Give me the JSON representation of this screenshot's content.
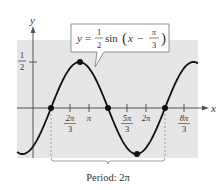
{
  "chart_data": {
    "type": "line",
    "function": "y = 0.5*sin(x - pi/3)",
    "xlabel": "x",
    "ylabel": "y",
    "x_ticks": [
      {
        "label_num": "2π",
        "label_den": "3",
        "value": 2.0944
      },
      {
        "label": "π",
        "value": 3.1416
      },
      {
        "label_num": "5π",
        "label_den": "3",
        "value": 5.236
      },
      {
        "label": "2π",
        "value": 6.2832
      },
      {
        "label_num": "8π",
        "label_den": "3",
        "value": 8.3776
      }
    ],
    "y_ticks": [
      {
        "label_num": "1",
        "label_den": "2",
        "value": 0.5
      }
    ],
    "key_points": [
      {
        "x": 1.0472,
        "y": 0,
        "desc": "π/3 zero"
      },
      {
        "x": 2.618,
        "y": 0.5,
        "desc": "max 5π/6"
      },
      {
        "x": 4.1888,
        "y": 0,
        "desc": "4π/3 zero"
      },
      {
        "x": 5.7596,
        "y": -0.5,
        "desc": "min 11π/6"
      },
      {
        "x": 7.3304,
        "y": 0,
        "desc": "7π/3 zero"
      }
    ],
    "xlim": [
      -0.3,
      8.9
    ],
    "ylim": [
      -0.58,
      0.72
    ],
    "amplitude": 0.5,
    "period": "2π",
    "phase_shift": "π/3",
    "annotation": "Period: 2π",
    "grid": false,
    "background": "#e8e8e8"
  },
  "labels": {
    "y_axis": "y",
    "x_axis": "x",
    "eq_y": "y",
    "eq_eq": "=",
    "eq_num": "1",
    "eq_den": "2",
    "eq_sin": "sin",
    "eq_x": "x",
    "eq_minus": "−",
    "eq_pi": "π",
    "eq_three": "3",
    "half_num": "1",
    "half_den": "2",
    "t1_num": "2π",
    "t1_den": "3",
    "t2": "π",
    "t3_num": "5π",
    "t3_den": "3",
    "t4": "2π",
    "t5_num": "8π",
    "t5_den": "3",
    "period": "Period: 2π"
  },
  "colors": {
    "plot_bg": "#e6e6e6",
    "curve": "#111111",
    "axis": "#555555",
    "text": "#333333"
  }
}
